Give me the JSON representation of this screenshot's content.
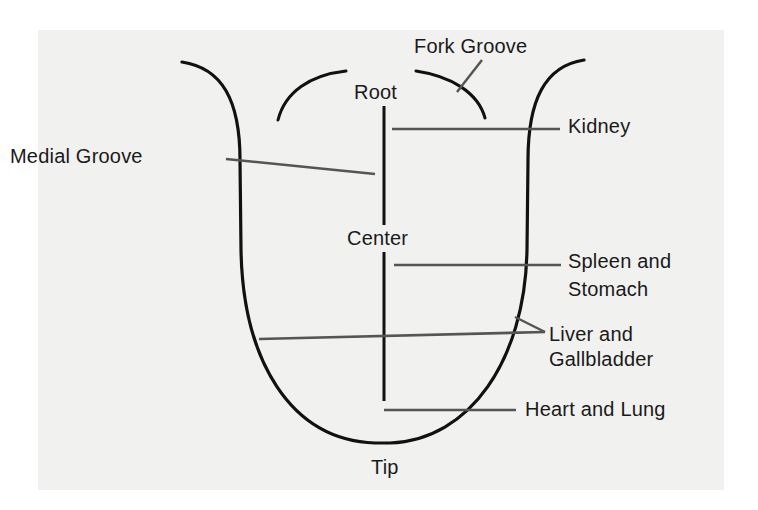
{
  "diagram": {
    "colors": {
      "background": "#ffffff",
      "panel": "#f1f1f0",
      "outline": "#111111",
      "leader": "#555555",
      "text": "#1a1a1a"
    },
    "labels": {
      "fork_groove": "Fork Groove",
      "root": "Root",
      "kidney": "Kidney",
      "medial_groove": "Medial Groove",
      "center": "Center",
      "spleen_line1": "Spleen and",
      "spleen_line2": "Stomach",
      "liver_line1": "Liver and",
      "liver_line2": "Gallbladder",
      "heart_lung": "Heart and Lung",
      "tip": "Tip"
    }
  }
}
